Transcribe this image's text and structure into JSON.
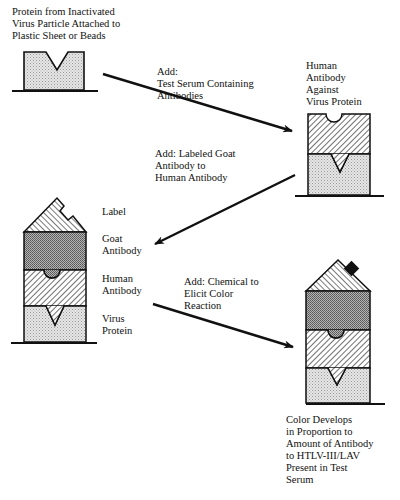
{
  "step1": {
    "caption": "Protein from Inactivated\nVirus Particle Attached to\nPlastic Sheet or Beads"
  },
  "arrow1": {
    "label": "Add:\nTest Serum Containing\nAntibodies"
  },
  "step2": {
    "caption": "Human\nAntibody\nAgainst\nVirus Protein"
  },
  "arrow2": {
    "label": "Add: Labeled Goat\nAntibody to\nHuman Antibody"
  },
  "step3": {
    "labels": {
      "label": "Label",
      "goat": "Goat\nAntibody",
      "human": "Human\nAntibody",
      "virus": "Virus\nProtein"
    }
  },
  "arrow3": {
    "label": "Add: Chemical to\nElicit Color\nReaction"
  },
  "step4": {
    "caption": "Color Develops\nin Proportion to\nAmount of Antibody\nto HTLV-III/LAV\nPresent in Test\nSerum"
  },
  "colors": {
    "ink": "#111111",
    "virus_protein_fill": "#d9d9d9",
    "goat_antibody_fill": "#9a9a9a",
    "background": "#ffffff"
  }
}
